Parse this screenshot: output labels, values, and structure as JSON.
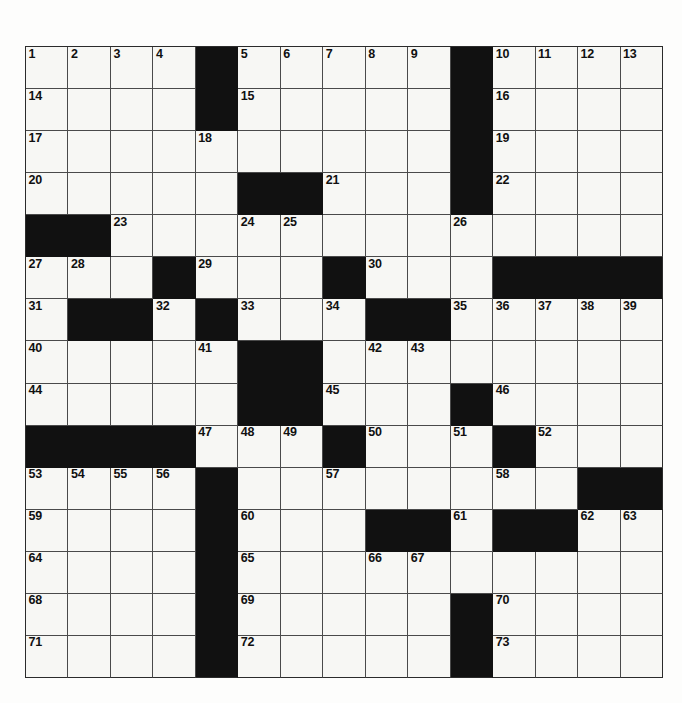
{
  "puzzle": {
    "type": "crossword",
    "title": "Crossword Puzzle Grid",
    "rows": 15,
    "columns": 15,
    "colors": {
      "block": "#111111",
      "open_cell": "#f7f7f4",
      "grid_line": "#4a4a4a",
      "border": "#2b2b2b",
      "number_text": "#101010",
      "page_background": "#fdfdfc"
    },
    "blocks": [
      [
        0,
        4
      ],
      [
        0,
        10
      ],
      [
        1,
        4
      ],
      [
        1,
        10
      ],
      [
        2,
        10
      ],
      [
        3,
        5
      ],
      [
        3,
        6
      ],
      [
        3,
        10
      ],
      [
        4,
        0
      ],
      [
        4,
        1
      ],
      [
        5,
        3
      ],
      [
        5,
        7
      ],
      [
        5,
        11
      ],
      [
        5,
        12
      ],
      [
        5,
        13
      ],
      [
        5,
        14
      ],
      [
        6,
        1
      ],
      [
        6,
        2
      ],
      [
        6,
        4
      ],
      [
        6,
        8
      ],
      [
        6,
        9
      ],
      [
        7,
        5
      ],
      [
        7,
        6
      ],
      [
        8,
        5
      ],
      [
        8,
        6
      ],
      [
        8,
        10
      ],
      [
        9,
        0
      ],
      [
        9,
        1
      ],
      [
        9,
        2
      ],
      [
        9,
        3
      ],
      [
        9,
        7
      ],
      [
        9,
        11
      ],
      [
        10,
        4
      ],
      [
        10,
        13
      ],
      [
        10,
        14
      ],
      [
        11,
        4
      ],
      [
        11,
        8
      ],
      [
        11,
        9
      ],
      [
        11,
        11
      ],
      [
        11,
        12
      ],
      [
        12,
        4
      ],
      [
        13,
        4
      ],
      [
        13,
        10
      ],
      [
        14,
        4
      ],
      [
        14,
        10
      ]
    ],
    "numbered_cells": [
      {
        "n": 1,
        "row": 0,
        "col": 0
      },
      {
        "n": 2,
        "row": 0,
        "col": 1
      },
      {
        "n": 3,
        "row": 0,
        "col": 2
      },
      {
        "n": 4,
        "row": 0,
        "col": 3
      },
      {
        "n": 5,
        "row": 0,
        "col": 5
      },
      {
        "n": 6,
        "row": 0,
        "col": 6
      },
      {
        "n": 7,
        "row": 0,
        "col": 7
      },
      {
        "n": 8,
        "row": 0,
        "col": 8
      },
      {
        "n": 9,
        "row": 0,
        "col": 9
      },
      {
        "n": 10,
        "row": 0,
        "col": 11
      },
      {
        "n": 11,
        "row": 0,
        "col": 12
      },
      {
        "n": 12,
        "row": 0,
        "col": 13
      },
      {
        "n": 13,
        "row": 0,
        "col": 14
      },
      {
        "n": 14,
        "row": 1,
        "col": 0
      },
      {
        "n": 15,
        "row": 1,
        "col": 5
      },
      {
        "n": 16,
        "row": 1,
        "col": 11
      },
      {
        "n": 17,
        "row": 2,
        "col": 0
      },
      {
        "n": 18,
        "row": 2,
        "col": 4
      },
      {
        "n": 19,
        "row": 2,
        "col": 11
      },
      {
        "n": 20,
        "row": 3,
        "col": 0
      },
      {
        "n": 21,
        "row": 3,
        "col": 7
      },
      {
        "n": 22,
        "row": 3,
        "col": 11
      },
      {
        "n": 23,
        "row": 4,
        "col": 2
      },
      {
        "n": 24,
        "row": 4,
        "col": 5
      },
      {
        "n": 25,
        "row": 4,
        "col": 6
      },
      {
        "n": 26,
        "row": 4,
        "col": 10
      },
      {
        "n": 27,
        "row": 5,
        "col": 0
      },
      {
        "n": 28,
        "row": 5,
        "col": 1
      },
      {
        "n": 29,
        "row": 5,
        "col": 4
      },
      {
        "n": 30,
        "row": 5,
        "col": 8
      },
      {
        "n": 31,
        "row": 6,
        "col": 0
      },
      {
        "n": 32,
        "row": 6,
        "col": 3
      },
      {
        "n": 33,
        "row": 6,
        "col": 5
      },
      {
        "n": 34,
        "row": 6,
        "col": 7
      },
      {
        "n": 35,
        "row": 6,
        "col": 10
      },
      {
        "n": 36,
        "row": 6,
        "col": 11
      },
      {
        "n": 37,
        "row": 6,
        "col": 12
      },
      {
        "n": 38,
        "row": 6,
        "col": 13
      },
      {
        "n": 39,
        "row": 6,
        "col": 14
      },
      {
        "n": 40,
        "row": 7,
        "col": 0
      },
      {
        "n": 41,
        "row": 7,
        "col": 4
      },
      {
        "n": 42,
        "row": 7,
        "col": 8
      },
      {
        "n": 43,
        "row": 7,
        "col": 9
      },
      {
        "n": 44,
        "row": 8,
        "col": 0
      },
      {
        "n": 45,
        "row": 8,
        "col": 7
      },
      {
        "n": 46,
        "row": 8,
        "col": 11
      },
      {
        "n": 47,
        "row": 9,
        "col": 4
      },
      {
        "n": 48,
        "row": 9,
        "col": 5
      },
      {
        "n": 49,
        "row": 9,
        "col": 6
      },
      {
        "n": 50,
        "row": 9,
        "col": 8
      },
      {
        "n": 51,
        "row": 9,
        "col": 10
      },
      {
        "n": 52,
        "row": 9,
        "col": 12
      },
      {
        "n": 53,
        "row": 10,
        "col": 0
      },
      {
        "n": 54,
        "row": 10,
        "col": 1
      },
      {
        "n": 55,
        "row": 10,
        "col": 2
      },
      {
        "n": 56,
        "row": 10,
        "col": 3
      },
      {
        "n": 57,
        "row": 10,
        "col": 7
      },
      {
        "n": 58,
        "row": 10,
        "col": 11
      },
      {
        "n": 59,
        "row": 11,
        "col": 0
      },
      {
        "n": 60,
        "row": 11,
        "col": 5
      },
      {
        "n": 61,
        "row": 11,
        "col": 10
      },
      {
        "n": 62,
        "row": 11,
        "col": 13
      },
      {
        "n": 63,
        "row": 11,
        "col": 14
      },
      {
        "n": 64,
        "row": 12,
        "col": 0
      },
      {
        "n": 65,
        "row": 12,
        "col": 5
      },
      {
        "n": 66,
        "row": 12,
        "col": 8
      },
      {
        "n": 67,
        "row": 12,
        "col": 9
      },
      {
        "n": 68,
        "row": 13,
        "col": 0
      },
      {
        "n": 69,
        "row": 13,
        "col": 5
      },
      {
        "n": 70,
        "row": 13,
        "col": 11
      },
      {
        "n": 71,
        "row": 14,
        "col": 0
      },
      {
        "n": 72,
        "row": 14,
        "col": 5
      },
      {
        "n": 73,
        "row": 14,
        "col": 11
      }
    ]
  }
}
